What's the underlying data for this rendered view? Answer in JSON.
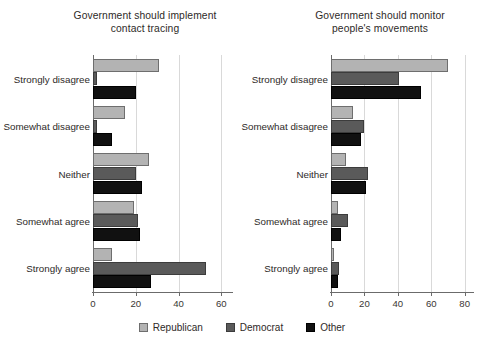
{
  "figure": {
    "legend": {
      "position": "bottom-center",
      "entries": [
        {
          "label": "Republican",
          "color": "#b3b3b3",
          "key": "republican"
        },
        {
          "label": "Democrat",
          "color": "#5a5a5a",
          "key": "democrat"
        },
        {
          "label": "Other",
          "color": "#111111",
          "key": "other"
        }
      ]
    }
  },
  "chart_data": [
    {
      "type": "bar",
      "orientation": "horizontal",
      "title": "Government should implement\ncontact tracing",
      "xlabel": "",
      "ylabel": "",
      "xlim": [
        0,
        65
      ],
      "xticks": [
        0,
        20,
        40,
        60
      ],
      "xtick_labels": [
        "0",
        "20",
        "40",
        "60"
      ],
      "grid": true,
      "grid_axis": "x",
      "legend": [
        "Republican",
        "Democrat",
        "Other"
      ],
      "categories": [
        "Strongly disagree",
        "Somewhat disagree",
        "Neither",
        "Somewhat agree",
        "Strongly agree"
      ],
      "series": [
        {
          "name": "Republican",
          "color": "#b3b3b3",
          "values": [
            31,
            15,
            26,
            19,
            9
          ]
        },
        {
          "name": "Democrat",
          "color": "#5a5a5a",
          "values": [
            2,
            2,
            20,
            21,
            53
          ]
        },
        {
          "name": "Other",
          "color": "#111111",
          "values": [
            20,
            9,
            23,
            22,
            27
          ]
        }
      ]
    },
    {
      "type": "bar",
      "orientation": "horizontal",
      "title": "Government should monitor\npeople's movements",
      "xlabel": "",
      "ylabel": "",
      "xlim": [
        0,
        85
      ],
      "xticks": [
        0,
        20,
        40,
        60,
        80
      ],
      "xtick_labels": [
        "0",
        "20",
        "40",
        "60",
        "80"
      ],
      "grid": true,
      "grid_axis": "x",
      "legend": [
        "Republican",
        "Democrat",
        "Other"
      ],
      "categories": [
        "Strongly disagree",
        "Somewhat disagree",
        "Neither",
        "Somewhat agree",
        "Strongly agree"
      ],
      "series": [
        {
          "name": "Republican",
          "color": "#b3b3b3",
          "values": [
            70,
            13,
            9,
            4,
            2
          ]
        },
        {
          "name": "Democrat",
          "color": "#5a5a5a",
          "values": [
            41,
            20,
            22,
            10,
            5
          ]
        },
        {
          "name": "Other",
          "color": "#111111",
          "values": [
            54,
            18,
            21,
            6,
            4
          ]
        }
      ]
    }
  ]
}
